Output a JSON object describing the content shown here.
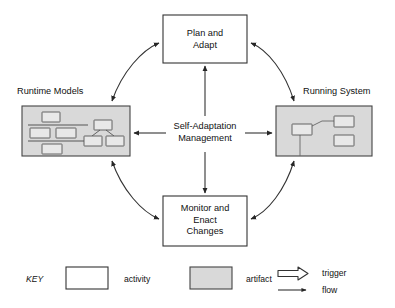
{
  "diagram": {
    "center": {
      "label": "Self-Adaptation\nManagement",
      "name": "center-label"
    },
    "activities": [
      {
        "id": "plan-and-adapt",
        "label": "Plan and\nAdapt",
        "type": "activity",
        "x": 163,
        "y": 15,
        "w": 84,
        "h": 48
      },
      {
        "id": "monitor-and-enact-changes",
        "label": "Monitor and\nEnact\nChanges",
        "type": "activity",
        "x": 163,
        "y": 196,
        "w": 84,
        "h": 50
      }
    ],
    "artifacts": [
      {
        "id": "runtime-models",
        "title": "Runtime Models",
        "title_x": 17,
        "title_y": 86,
        "type": "artifact",
        "x": 22,
        "y": 106,
        "w": 108,
        "h": 50
      },
      {
        "id": "running-system",
        "title": "Running System",
        "title_x": 303,
        "title_y": 86,
        "type": "artifact",
        "x": 276,
        "y": 106,
        "w": 96,
        "h": 50
      }
    ],
    "flows": [
      {
        "from": "self-adaptation-management",
        "to": "plan-and-adapt",
        "kind": "flow",
        "direction": "up"
      },
      {
        "from": "self-adaptation-management",
        "to": "monitor-and-enact-changes",
        "kind": "flow",
        "direction": "down"
      },
      {
        "from": "self-adaptation-management",
        "to": "runtime-models",
        "kind": "flow",
        "direction": "left"
      },
      {
        "from": "self-adaptation-management",
        "to": "running-system",
        "kind": "flow",
        "direction": "right"
      }
    ],
    "triggers": [
      {
        "between": [
          "runtime-models",
          "plan-and-adapt"
        ],
        "kind": "trigger",
        "bidirectional": true
      },
      {
        "between": [
          "plan-and-adapt",
          "running-system"
        ],
        "kind": "trigger",
        "bidirectional": true
      },
      {
        "between": [
          "runtime-models",
          "monitor-and-enact-changes"
        ],
        "kind": "trigger",
        "bidirectional": true
      },
      {
        "between": [
          "monitor-and-enact-changes",
          "running-system"
        ],
        "kind": "trigger",
        "bidirectional": true
      }
    ],
    "colors": {
      "artifact_fill": "#d9d9d9",
      "artifact_inner_fill": "#e6e6e6",
      "activity_fill": "#ffffff",
      "stroke": "#333333",
      "text": "#111111",
      "background": "#ffffff"
    }
  },
  "key": {
    "title": "KEY",
    "entries": [
      {
        "swatch": "activity-swatch",
        "label": "activity"
      },
      {
        "swatch": "artifact-swatch",
        "label": "artifact"
      },
      {
        "swatch": "trigger-arrow",
        "label": "trigger"
      },
      {
        "swatch": "flow-arrow",
        "label": "flow"
      }
    ]
  }
}
